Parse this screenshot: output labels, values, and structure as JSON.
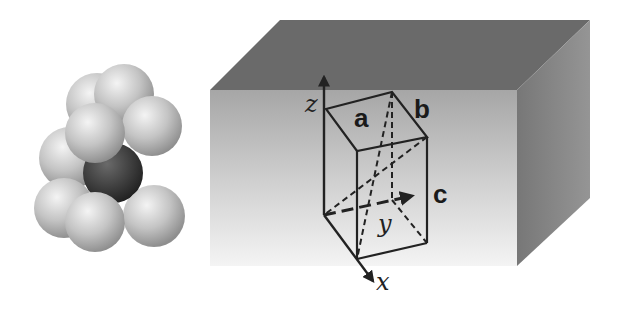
{
  "figure": {
    "left_panel": {
      "description": "hexagonal close-packed atom cluster",
      "sphere_color": "#bdbdbd",
      "center_sphere_color": "#3a3a3a"
    },
    "right_panel": {
      "description": "crystal slab with orthorhombic unit cell",
      "lattice_labels": {
        "a": "a",
        "b": "b",
        "c": "c"
      },
      "axis_labels": {
        "x": "x",
        "y": "y",
        "z": "z"
      },
      "colors": {
        "top_face": "#6a6a6a",
        "side_face": "#8a8a8a",
        "front_face_top": "#a8a8a8",
        "front_face_bottom": "#f2f2f2",
        "lines": "#222222"
      }
    }
  }
}
